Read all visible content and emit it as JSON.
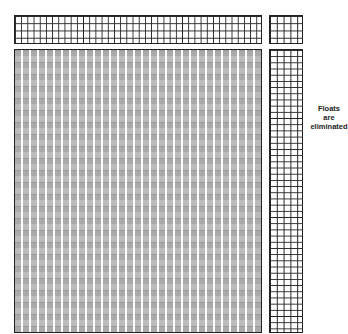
{
  "threading": {
    "shafts": 4,
    "rows": [
      {
        "shaft": "4",
        "label": "4"
      },
      {
        "shaft": "3",
        "label": "3"
      },
      {
        "shaft": "2",
        "label": "2"
      },
      {
        "shaft": "1",
        "label": "1"
      }
    ]
  },
  "tieup": {
    "rows": [
      "4 4 4",
      "3 3 3",
      "2 2 2",
      "1 1 1"
    ]
  },
  "treadling": {
    "sequence": [
      "1",
      "2",
      "2",
      "3",
      "3",
      "4",
      "4",
      "3",
      "3",
      "2",
      "2",
      "1",
      "1",
      "4",
      "4",
      "3",
      "3",
      "2",
      "2",
      "1"
    ]
  },
  "annotation": {
    "line1": "Floats",
    "line2": "are",
    "line3": "eliminated"
  }
}
